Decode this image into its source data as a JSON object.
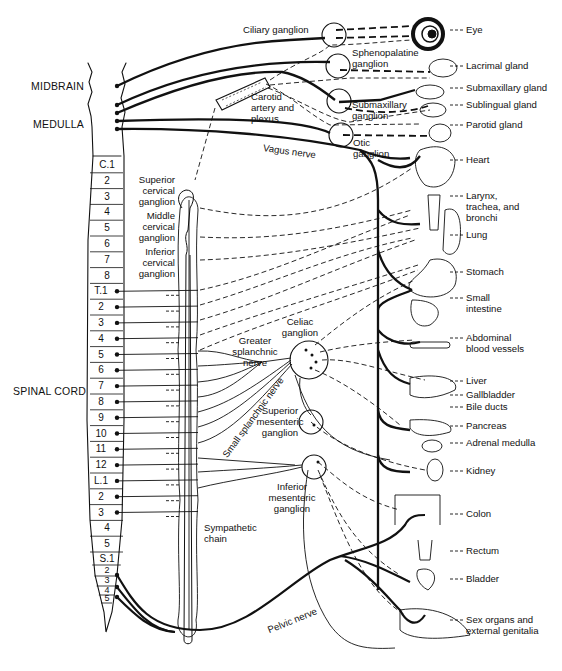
{
  "figure": {
    "regions": {
      "midbrain": "MIDBRAIN",
      "medulla": "MEDULLA",
      "spinal_cord": "SPINAL CORD"
    },
    "spinal_segments": [
      "C.1",
      "2",
      "3",
      "4",
      "5",
      "6",
      "7",
      "8",
      "T.1",
      "2",
      "3",
      "4",
      "5",
      "6",
      "7",
      "8",
      "9",
      "10",
      "11",
      "12",
      "L.1",
      "2",
      "3",
      "4",
      "5",
      "S.1",
      "2",
      "3",
      "4",
      "5"
    ],
    "ganglia": {
      "ciliary": "Ciliary ganglion",
      "sphenopalatine_1": "Sphenopalatine",
      "sphenopalatine_2": "ganglion",
      "submaxillary_1": "Submaxillary",
      "submaxillary_2": "ganglion",
      "otic_1": "Otic",
      "otic_2": "ganglion",
      "superior_cervical": [
        "Superior",
        "cervical",
        "ganglion"
      ],
      "middle_cervical": [
        "Middle",
        "cervical",
        "ganglion"
      ],
      "inferior_cervical": [
        "Inferior",
        "cervical",
        "ganglion"
      ],
      "celiac": [
        "Celiac",
        "ganglion"
      ],
      "superior_mesenteric": [
        "Superior",
        "mesenteric",
        "ganglion"
      ],
      "inferior_mesenteric": [
        "Inferior",
        "mesenteric",
        "ganglion"
      ],
      "sympathetic_chain": [
        "Sympathetic",
        "chain"
      ]
    },
    "nerves": {
      "carotid": [
        "Carotid",
        "artery and",
        "plexus"
      ],
      "vagus": "Vagus nerve",
      "greater_splanchnic": [
        "Greater",
        "splanchnic",
        "nerve"
      ],
      "small_splanchnic": "Small splanchnic nerve",
      "pelvic": "Pelvic nerve"
    },
    "organs": [
      {
        "label": "Eye",
        "y": 30
      },
      {
        "label": "Lacrimal gland",
        "y": 66
      },
      {
        "label": "Submaxillary gland",
        "y": 88
      },
      {
        "label": "Sublingual gland",
        "y": 105
      },
      {
        "label": "Parotid gland",
        "y": 125
      },
      {
        "label": "Heart",
        "y": 160
      },
      {
        "label": "Larynx,\ntrachea, and\nbronchi",
        "y": 196
      },
      {
        "label": "Lung",
        "y": 235
      },
      {
        "label": "Stomach",
        "y": 272
      },
      {
        "label": "Small\nintestine",
        "y": 298
      },
      {
        "label": "Abdominal\nblood vessels",
        "y": 338
      },
      {
        "label": "Liver",
        "y": 381
      },
      {
        "label": "Gallbladder",
        "y": 395
      },
      {
        "label": "Bile ducts",
        "y": 407
      },
      {
        "label": "Pancreas",
        "y": 426
      },
      {
        "label": "Adrenal medulla",
        "y": 443
      },
      {
        "label": "Kidney",
        "y": 471
      },
      {
        "label": "Colon",
        "y": 514
      },
      {
        "label": "Rectum",
        "y": 551
      },
      {
        "label": "Bladder",
        "y": 579
      },
      {
        "label": "Sex organs and\nexternal genitalia",
        "y": 620
      }
    ]
  }
}
